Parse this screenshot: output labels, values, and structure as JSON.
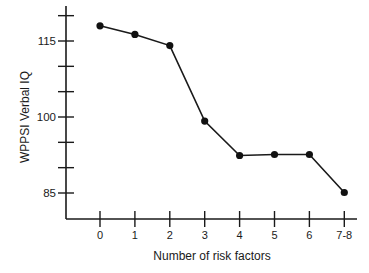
{
  "chart_data": {
    "type": "line",
    "title": "",
    "xlabel": "Number of risk factors",
    "ylabel": "WPPSI Verbal IQ",
    "categories": [
      "0",
      "1",
      "2",
      "3",
      "4",
      "5",
      "6",
      "7-8"
    ],
    "series": [
      {
        "name": "WPPSI Verbal IQ",
        "values": [
          118,
          116.3,
          114.1,
          99.2,
          92.4,
          92.6,
          92.6,
          85.1
        ]
      }
    ],
    "ylim": [
      80,
      120
    ],
    "y_ticks": [
      85,
      90,
      95,
      100,
      105,
      110,
      115,
      120
    ],
    "y_tick_labels": {
      "85": "85",
      "100": "100",
      "115": "115"
    },
    "grid": false,
    "legend": "none",
    "colors": {
      "line": "#1a1a1a",
      "marker": "#111111",
      "axis": "#1a1a1a"
    }
  }
}
